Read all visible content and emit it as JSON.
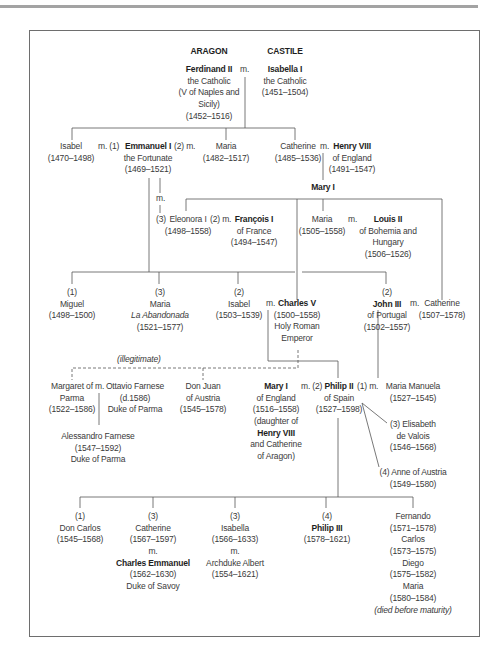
{
  "header": {
    "house_left": "ARAGON",
    "house_right": "CASTILE"
  },
  "people": {
    "ferdinand_ii": [
      "Ferdinand II",
      "the Catholic",
      "(V of Naples and",
      "Sicily)",
      "(1452–1516)"
    ],
    "isabella_i": [
      "Isabella I",
      "the Catholic",
      "(1451–1504)"
    ],
    "isabel_1470": [
      "Isabel",
      "(1470–1498)"
    ],
    "emmanuel_i": [
      "Emmanuel I",
      "the Fortunate",
      "(1469–1521)"
    ],
    "maria_1482": [
      "Maria",
      "(1482–1517)"
    ],
    "catherine_1485": [
      "Catherine",
      "(1485–1536)"
    ],
    "henry_viii": [
      "Henry VIII",
      "of England",
      "(1491–1547)"
    ],
    "mary_i_top": [
      "Mary I"
    ],
    "eleonora_i": [
      "Eleonora I",
      "(1498–1558)"
    ],
    "francois_i": [
      "François I",
      "of France",
      "(1494–1547)"
    ],
    "maria_1505": [
      "Maria",
      "(1505–1558)"
    ],
    "louis_ii": [
      "Louis II",
      "of Bohemia and",
      "Hungary",
      "(1506–1526)"
    ],
    "miguel": [
      "(1)",
      "Miguel",
      "(1498–1500)"
    ],
    "maria_abandonada": [
      "(3)",
      "Maria",
      "La Abandonada",
      "(1521–1577)"
    ],
    "isabel_1503": [
      "(2)",
      "Isabel",
      "(1503–1539)"
    ],
    "charles_v": [
      "Charles V",
      "(1500–1558)",
      "Holy Roman",
      "Emperor"
    ],
    "john_iii": [
      "(2)",
      "John III",
      "of Portugal",
      "(1502–1557)"
    ],
    "catherine_1507": [
      "Catherine",
      "(1507–1578)"
    ],
    "margaret_of_parma": [
      "Margaret of",
      "Parma",
      "(1522–1586)"
    ],
    "ottavio_farnese": [
      "Ottavio Farnese",
      "(d.1586)",
      "Duke of Parma"
    ],
    "alessandro_farnese": [
      "Alessandro Farnese",
      "(1547–1592)",
      "Duke of Parma"
    ],
    "don_juan": [
      "Don Juan",
      "of Austria",
      "(1545–1578)"
    ],
    "mary_i_england": [
      "Mary I",
      "of England",
      "(1516–1558)",
      "(daughter of",
      "Henry VIII",
      "and Catherine",
      "of Aragon)"
    ],
    "philip_ii": [
      "Philip II",
      "of Spain",
      "(1527–1598)"
    ],
    "maria_manuela": [
      "Maria Manuela",
      "(1527–1545)"
    ],
    "elisabeth_de_valois": [
      "(3)  Elisabeth",
      "de Valois",
      "(1546–1568)"
    ],
    "anne_of_austria": [
      "(4)  Anne of Austria",
      "(1549–1580)"
    ],
    "don_carlos": [
      "(1)",
      "Don Carlos",
      "(1545–1568)"
    ],
    "catherine_1567": [
      "(3)",
      "Catherine",
      "(1567–1597)",
      "m.",
      "Charles Emmanuel",
      "(1562–1630)",
      "Duke of Savoy"
    ],
    "isabella_1566": [
      "(3)",
      "Isabella",
      "(1566–1633)",
      "m.",
      "Archduke Albert",
      "(1554–1621)"
    ],
    "philip_iii": [
      "(4)",
      "Philip III",
      "(1578–1621)"
    ],
    "other_children": [
      "Fernando",
      "(1571–1578)",
      "Carlos",
      "(1573–1575)",
      "Diego",
      "(1575–1582)",
      "Maria",
      "(1580–1584)",
      "(died before maturity)"
    ]
  },
  "marriage_labels": {
    "ferdinand_isabella": "m.",
    "isabel_emmanuel": "m. (1)",
    "emmanuel_maria": "(2) m.",
    "catherine_henry": "m.",
    "emmanuel_eleonora": "m.",
    "eleonora_order": "(3)",
    "eleonora_francois": "(2) m.",
    "maria_louis": "m.",
    "isabel_charles": "m.",
    "john_catherine": "m.",
    "margaret_ottavio": "m.",
    "mary_philip": "m. (2)",
    "philip_maria_manuela": "(1) m."
  },
  "annotations": {
    "illegitimate": "(illegitimate)"
  },
  "colors": {
    "line": "#555555",
    "frame": "#6e6e6e",
    "rule": "#a3a3a3",
    "text": "#3a3a3a"
  }
}
